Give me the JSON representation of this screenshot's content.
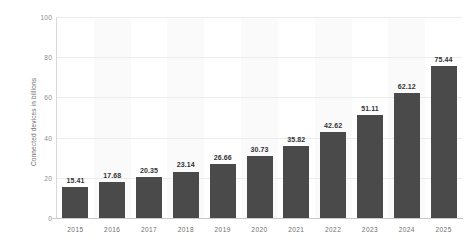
{
  "chart_data": {
    "type": "bar",
    "title": "",
    "subtitle": "",
    "xlabel": "",
    "ylabel": "Connected devices in billions",
    "categories": [
      "2015",
      "2016",
      "2017",
      "2018",
      "2019",
      "2020",
      "2021",
      "2022",
      "2023",
      "2024",
      "2025"
    ],
    "values": [
      15.41,
      17.68,
      20.35,
      23.14,
      26.66,
      30.73,
      35.82,
      42.62,
      51.11,
      62.12,
      75.44
    ],
    "value_labels": [
      "15.41",
      "17.68",
      "20.35",
      "23.14",
      "26.66",
      "30.73",
      "35.82",
      "42.62",
      "51.11",
      "62.12",
      "75.44"
    ],
    "ylim": [
      0,
      100
    ],
    "yticks": [
      0,
      20,
      40,
      60,
      80,
      100
    ],
    "ytick_labels": [
      "0",
      "20",
      "40",
      "60",
      "80",
      "100"
    ],
    "grid": true,
    "grid_axis": "y",
    "legend": false,
    "legend_position": "none",
    "bar_color": "#4a4a4a",
    "gridline_color": "#ececec",
    "band_color": "#fafafa",
    "axis_text_color": "#6e6e6e",
    "value_label_color": "#333333",
    "background_color": "#ffffff"
  }
}
